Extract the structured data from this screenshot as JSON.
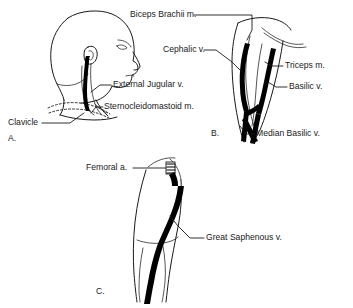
{
  "figure": {
    "background_color": "#ffffff",
    "ink_color": "#1a1a1a",
    "vessel_color": "#000000"
  },
  "panels": [
    {
      "id": "A",
      "letter": "A.",
      "name": "head-and-neck-panel",
      "region": "Head and neck, lateral view",
      "labels": [
        {
          "key": "external_jugular",
          "text": "External Jugular v.",
          "name": "label-external-jugular-vein",
          "x": 113,
          "y": 85,
          "anchor": "start"
        },
        {
          "key": "sternocleidomastoid",
          "text": "Sternocleidomastoid m.",
          "name": "label-sternocleidomastoid-muscle",
          "x": 104,
          "y": 107,
          "anchor": "start"
        },
        {
          "key": "clavicle",
          "text": "Clavicle",
          "name": "label-clavicle",
          "x": 8,
          "y": 123,
          "anchor": "start"
        }
      ]
    },
    {
      "id": "B",
      "letter": "B.",
      "name": "upper-arm-panel",
      "region": "Antecubital fossa and upper arm",
      "labels": [
        {
          "key": "biceps_brachii",
          "text": "Biceps Brachii m.",
          "name": "label-biceps-brachii-muscle",
          "x": 130,
          "y": 15,
          "anchor": "start"
        },
        {
          "key": "cephalic",
          "text": "Cephalic v.",
          "name": "label-cephalic-vein",
          "x": 165,
          "y": 50,
          "anchor": "start"
        },
        {
          "key": "triceps",
          "text": "Triceps m.",
          "name": "label-triceps-muscle",
          "x": 285,
          "y": 66,
          "anchor": "start"
        },
        {
          "key": "basilic",
          "text": "Basilic v.",
          "name": "label-basilic-vein",
          "x": 289,
          "y": 87,
          "anchor": "start"
        },
        {
          "key": "median_basilic",
          "text": "Median Basilic v.",
          "name": "label-median-basilic-vein",
          "x": 256,
          "y": 134,
          "anchor": "start"
        }
      ]
    },
    {
      "id": "C",
      "letter": "C.",
      "name": "leg-panel",
      "region": "Thigh and leg, medial view",
      "labels": [
        {
          "key": "femoral_artery",
          "text": "Femoral a.",
          "name": "label-femoral-artery",
          "x": 86,
          "y": 168,
          "anchor": "start"
        },
        {
          "key": "great_saphenous",
          "text": "Great Saphenous v.",
          "name": "label-great-saphenous-vein",
          "x": 206,
          "y": 238,
          "anchor": "start"
        }
      ]
    }
  ],
  "panel_letters": [
    {
      "id": "A",
      "text": "A.",
      "name": "panel-letter-a",
      "x": 8,
      "y": 139
    },
    {
      "id": "B",
      "text": "B.",
      "name": "panel-letter-b",
      "x": 211,
      "y": 134
    },
    {
      "id": "C",
      "text": "C.",
      "name": "panel-letter-c",
      "x": 96,
      "y": 292
    }
  ]
}
